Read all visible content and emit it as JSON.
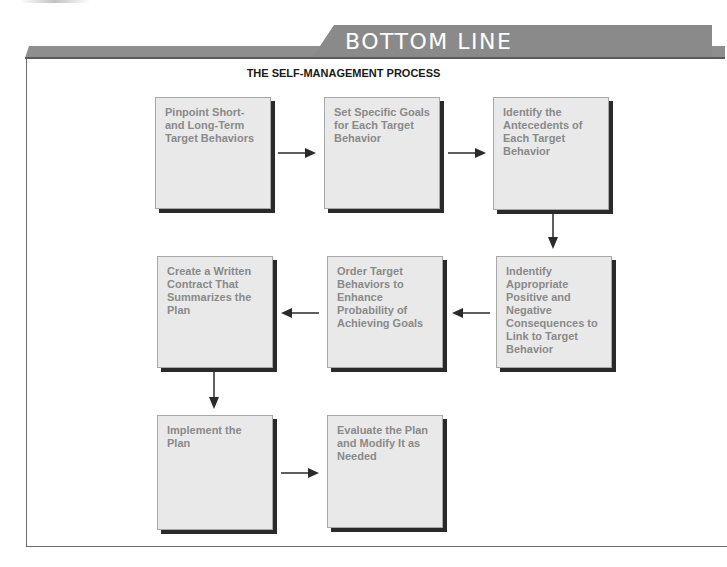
{
  "banner": {
    "title": "BOTTOM LINE",
    "tab_color": "#8a8a8a"
  },
  "diagram": {
    "title": "THE SELF-MANAGEMENT PROCESS",
    "steps": [
      {
        "label": "Pinpoint Short- and Long-Term Target Behaviors"
      },
      {
        "label": "Set Specific Goals for Each Target Behavior"
      },
      {
        "label": "Identify the Antecedents of Each Target Behavior"
      },
      {
        "label": "Indentify Appropriate Positive and Negative Consequences to Link to Target Behavior"
      },
      {
        "label": "Order Target Behaviors to Enhance Probability of Achieving Goals"
      },
      {
        "label": "Create a Written Contract That Summarizes the Plan"
      },
      {
        "label": "Implement the Plan"
      },
      {
        "label": "Evaluate the Plan and Modify It as Needed"
      }
    ],
    "flow": [
      "1→2",
      "2→3",
      "3↓4",
      "4←5",
      "5←6",
      "6↓7",
      "7→8"
    ],
    "colors": {
      "box_fill": "#e9e9e9",
      "box_text": "#8a8a8a",
      "box_shadow": "#2a2a2a",
      "arrow": "#2a2a2a"
    }
  }
}
